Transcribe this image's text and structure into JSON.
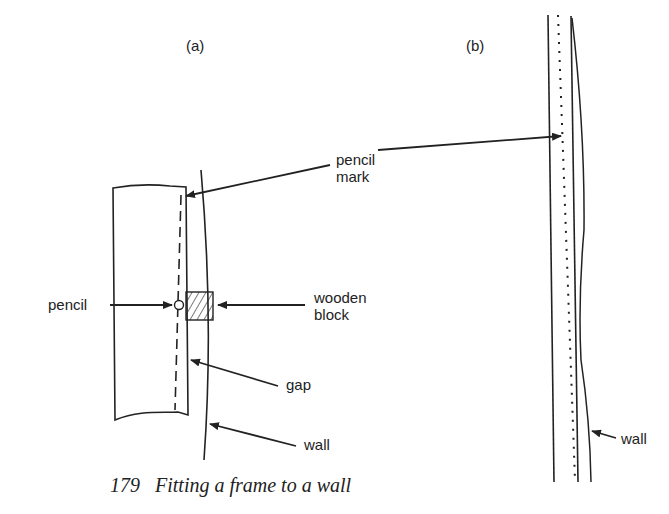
{
  "figure": {
    "number": "179",
    "caption": "Fitting a frame to a wall"
  },
  "panels": [
    {
      "id": "a",
      "label": "(a)"
    },
    {
      "id": "b",
      "label": "(b)"
    }
  ],
  "labels": {
    "pencil_mark": [
      "pencil",
      "mark"
    ],
    "pencil": "pencil",
    "wooden_block": [
      "wooden",
      "block"
    ],
    "gap": "gap",
    "wall_a": "wall",
    "wall_b": "wall"
  }
}
